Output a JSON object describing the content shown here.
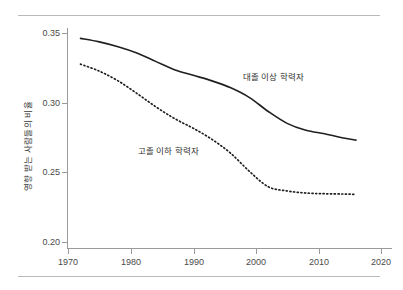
{
  "chart_data": {
    "type": "line",
    "title": "",
    "xlabel": "",
    "ylabel": "영향 받는 사람들의 비율",
    "xlim": [
      1970,
      2020
    ],
    "ylim": [
      0.2,
      0.35
    ],
    "xticks": [
      "1970",
      "1980",
      "1990",
      "2000",
      "2010",
      "2020"
    ],
    "yticks": [
      "0.20",
      "0.25",
      "0.30",
      "0.35"
    ],
    "grid": false,
    "legend_position": "inline-annotation",
    "series": [
      {
        "name": "대졸 이상 학력자",
        "style": "solid",
        "color": "#1f1f1f",
        "x": [
          1972,
          1975,
          1978,
          1981,
          1984,
          1987,
          1990,
          1993,
          1996,
          1999,
          2002,
          2005,
          2008,
          2011,
          2014,
          2016
        ],
        "values": [
          0.3465,
          0.344,
          0.3405,
          0.336,
          0.33,
          0.324,
          0.32,
          0.316,
          0.311,
          0.304,
          0.294,
          0.2855,
          0.2805,
          0.278,
          0.275,
          0.2735
        ]
      },
      {
        "name": "고졸 이하 학력자",
        "style": "dotted",
        "color": "#1f1f1f",
        "x": [
          1972,
          1975,
          1978,
          1981,
          1984,
          1987,
          1990,
          1993,
          1996,
          1999,
          2002,
          2005,
          2008,
          2011,
          2014,
          2016
        ],
        "values": [
          0.328,
          0.323,
          0.316,
          0.307,
          0.2975,
          0.289,
          0.282,
          0.274,
          0.264,
          0.251,
          0.24,
          0.237,
          0.2355,
          0.235,
          0.2348,
          0.2345
        ]
      }
    ],
    "annotations": [
      {
        "text": "대졸 이상 학력자",
        "x": 243,
        "y": 70
      },
      {
        "text": "고졸 이하 학력자",
        "x": 138,
        "y": 144
      }
    ]
  },
  "axes": {
    "y_tick_positions": [
      242,
      172,
      103,
      33
    ],
    "x_tick_positions": [
      68,
      131,
      194,
      256,
      319,
      381
    ]
  }
}
